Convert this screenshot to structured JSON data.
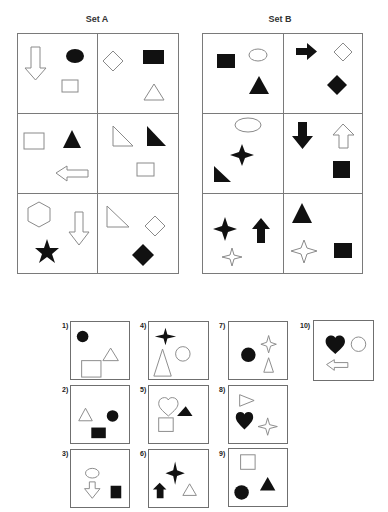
{
  "sets": [
    {
      "title": "Set A",
      "cells": [
        {
          "shapes": [
            "outline down arrow",
            "filled ellipse",
            "outline rectangle"
          ]
        },
        {
          "shapes": [
            "outline diamond",
            "filled rectangle",
            "outline triangle"
          ]
        },
        {
          "shapes": [
            "outline rectangle",
            "filled triangle",
            "outline left arrow"
          ]
        },
        {
          "shapes": [
            "outline right triangle",
            "filled right triangle",
            "outline rectangle"
          ]
        },
        {
          "shapes": [
            "outline hexagon",
            "outline down arrow",
            "filled star"
          ]
        },
        {
          "shapes": [
            "outline right triangle",
            "outline diamond",
            "filled diamond"
          ]
        }
      ]
    },
    {
      "title": "Set B",
      "cells": [
        {
          "shapes": [
            "filled rectangle",
            "outline ellipse",
            "filled triangle"
          ]
        },
        {
          "shapes": [
            "filled right arrow",
            "outline diamond",
            "filled diamond"
          ]
        },
        {
          "shapes": [
            "outline ellipse",
            "filled four-point star",
            "filled right triangle"
          ]
        },
        {
          "shapes": [
            "filled down arrow",
            "outline up arrow",
            "filled square"
          ]
        },
        {
          "shapes": [
            "filled four-point star",
            "filled up arrow",
            "outline four-point star"
          ]
        },
        {
          "shapes": [
            "filled triangle",
            "outline four-point star",
            "filled square"
          ]
        }
      ]
    }
  ],
  "options": [
    {
      "label": "1)",
      "shapes": [
        "filled circle",
        "outline rectangle",
        "outline triangle"
      ]
    },
    {
      "label": "2)",
      "shapes": [
        "outline triangle",
        "filled circle",
        "filled rectangle"
      ]
    },
    {
      "label": "3)",
      "shapes": [
        "outline ellipse",
        "outline down arrow",
        "filled rectangle"
      ]
    },
    {
      "label": "4)",
      "shapes": [
        "filled four-point star",
        "outline triangle",
        "outline circle"
      ]
    },
    {
      "label": "5)",
      "shapes": [
        "outline heart",
        "filled triangle",
        "outline square"
      ]
    },
    {
      "label": "6)",
      "shapes": [
        "filled four-point star",
        "filled up arrow",
        "outline triangle"
      ]
    },
    {
      "label": "7)",
      "shapes": [
        "outline four-point star",
        "filled circle",
        "outline triangle"
      ]
    },
    {
      "label": "8)",
      "shapes": [
        "outline right-pointing triangle",
        "filled heart",
        "outline four-point star"
      ]
    },
    {
      "label": "9)",
      "shapes": [
        "outline square",
        "filled triangle",
        "filled circle"
      ]
    },
    {
      "label": "10)",
      "shapes": [
        "filled heart",
        "outline circle",
        "outline left arrow"
      ]
    }
  ],
  "colors": {
    "ink": "#111111",
    "outline": "#8a8a8a",
    "border": "#7a7a7a"
  }
}
